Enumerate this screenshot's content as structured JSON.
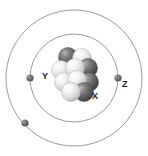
{
  "diagram": {
    "type": "bohr-atom-model",
    "background_color": "#ffffff",
    "width": 148,
    "height": 156,
    "center": {
      "x": 74,
      "y": 78
    }
  },
  "shells": [
    {
      "name": "inner-shell",
      "label": "inner orbit",
      "radius": 44,
      "stroke_color": "#9a9a9a",
      "stroke_width": 1
    },
    {
      "name": "outer-shell",
      "label": "outer orbit",
      "radius": 68,
      "stroke_color": "#9a9a9a",
      "stroke_width": 1
    }
  ],
  "electrons": [
    {
      "name": "electron-y",
      "shell": "inner-shell",
      "x": 30,
      "y": 78,
      "radius": 3.6,
      "color": "#6e6e6e",
      "label": "Y"
    },
    {
      "name": "electron-z",
      "shell": "outer-shell",
      "x": 118,
      "y": 78,
      "radius": 3.6,
      "color": "#6e6e6e",
      "label": "Z"
    },
    {
      "name": "electron-lower-left",
      "shell": "outer-shell",
      "x": 25,
      "y": 123,
      "radius": 3.6,
      "color": "#6e6e6e",
      "label": ""
    }
  ],
  "labels": [
    {
      "name": "label-y",
      "text": "Y",
      "points_to": "electron-y"
    },
    {
      "name": "label-z",
      "text": "Z",
      "points_to": "electron-z"
    },
    {
      "name": "label-x",
      "text": "X",
      "points_to": "nucleon-x"
    }
  ],
  "nucleus": {
    "name": "nucleus",
    "center": {
      "x": 74,
      "y": 76
    },
    "particle_radius": 9.5,
    "colors": {
      "dark": "#5e5e5e",
      "dark_highlight": "#a8a8a8",
      "dark_shadow": "#333333",
      "light": "#f0f0f0",
      "light_highlight": "#ffffff",
      "light_shadow": "#a9a9a9"
    },
    "particles": [
      {
        "name": "nucleon-1",
        "x": 68,
        "y": 57,
        "shade": "dark"
      },
      {
        "name": "nucleon-2",
        "x": 82,
        "y": 58,
        "shade": "light"
      },
      {
        "name": "nucleon-3",
        "x": 61,
        "y": 70,
        "shade": "light"
      },
      {
        "name": "nucleon-4",
        "x": 75,
        "y": 68,
        "shade": "light"
      },
      {
        "name": "nucleon-5",
        "x": 88,
        "y": 68,
        "shade": "dark"
      },
      {
        "name": "nucleon-6",
        "x": 64,
        "y": 82,
        "shade": "light"
      },
      {
        "name": "nucleon-7",
        "x": 77,
        "y": 80,
        "shade": "light"
      },
      {
        "name": "nucleon-x",
        "x": 89,
        "y": 82,
        "shade": "dark"
      },
      {
        "name": "nucleon-9",
        "x": 71,
        "y": 92,
        "shade": "light"
      },
      {
        "name": "nucleon-10",
        "x": 84,
        "y": 92,
        "shade": "dark"
      }
    ]
  }
}
